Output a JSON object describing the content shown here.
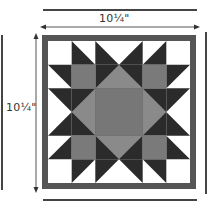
{
  "diagram": {
    "width_label": "10¼\"",
    "height_label": "10¼\"",
    "grid_size": 6,
    "colors": {
      "dark": "#2b2b2b",
      "frame": "#555555",
      "center": "#777777",
      "diamond": "#8a8a8a",
      "accent_square": "#7a7a7a",
      "white": "#ffffff",
      "strip": "#444444"
    },
    "components": [
      "outer-frame",
      "corner-white-squares",
      "star-points-dark",
      "gray-diamond",
      "center-square",
      "accent-squares"
    ]
  }
}
